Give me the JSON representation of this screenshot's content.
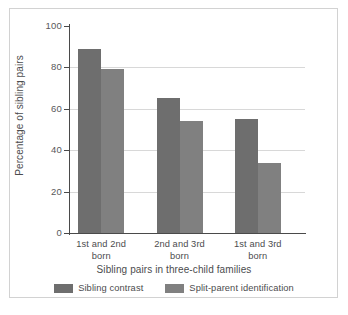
{
  "chart_data": {
    "type": "bar",
    "title": "",
    "subtitle": "",
    "xlabel": "Sibling pairs in three-child families",
    "ylabel": "Percentage of sibling pairs",
    "categories": [
      "1st and 2nd born",
      "2nd and 3rd born",
      "1st and 3rd born"
    ],
    "category_lines": [
      [
        "1st and 2nd",
        "born"
      ],
      [
        "2nd and 3rd",
        "born"
      ],
      [
        "1st and 3rd",
        "born"
      ]
    ],
    "series": [
      {
        "name": "Sibling contrast",
        "color": "#6e6e6e",
        "values": [
          89,
          65,
          55
        ]
      },
      {
        "name": "Split-parent identification",
        "color": "#808080",
        "values": [
          79,
          54,
          34
        ]
      }
    ],
    "ylim": [
      0,
      100
    ],
    "yticks": [
      0,
      20,
      40,
      60,
      80,
      100
    ],
    "ytick_labels": [
      "0",
      "20",
      "40",
      "60",
      "80",
      "100"
    ],
    "gridlines": [
      20,
      40,
      60,
      80
    ],
    "grid": true,
    "grid_color": "#d8d8d8",
    "axis_color": "#4a4a4a",
    "legend_position": "bottom",
    "background": "#ffffff",
    "border_color": "#d2d2d2"
  }
}
